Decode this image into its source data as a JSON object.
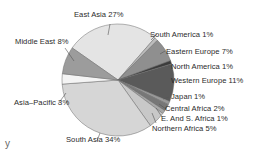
{
  "chart_data": {
    "type": "pie",
    "title": "",
    "start_angle_deg": -55,
    "direction": "clockwise",
    "slices": [
      {
        "label": "East Asia",
        "value": 27,
        "text": "East Asia 27%",
        "color": "#e4e4e4"
      },
      {
        "label": "South America",
        "value": 1,
        "text": "South America 1%",
        "color": "#bdbdbd"
      },
      {
        "label": "Eastern Europe",
        "value": 7,
        "text": "Eastern Europe 7%",
        "color": "#8f8f8f"
      },
      {
        "label": "North America",
        "value": 1,
        "text": "North America 1%",
        "color": "#3c3c3c"
      },
      {
        "label": "Western Europe",
        "value": 11,
        "text": "Western Europe 11%",
        "color": "#5a5a5a"
      },
      {
        "label": "Japan",
        "value": 1,
        "text": "Japan 1%",
        "color": "#9a9a9a"
      },
      {
        "label": "Central Africa",
        "value": 2,
        "text": "Central Africa 2%",
        "color": "#777777"
      },
      {
        "label": "E. And S. Africa",
        "value": 1,
        "text": "E. And S. Africa 1%",
        "color": "#a8a8a8"
      },
      {
        "label": "Northern Africa",
        "value": 5,
        "text": "Northern Africa 5%",
        "color": "#c8c8c8"
      },
      {
        "label": "South Asia",
        "value": 34,
        "text": "South Asia 34%",
        "color": "#d6d6d6"
      },
      {
        "label": "Asia-Pacific",
        "value": 3,
        "text": "Asia–Pacific 3%",
        "color": "#f4f4f4"
      },
      {
        "label": "Middle East",
        "value": 8,
        "text": "Middle East 8%",
        "color": "#9c9c9c"
      }
    ],
    "legend": "none (leader-line labels)"
  },
  "labels": {
    "east_asia": "East Asia 27%",
    "middle_east": "Middle East 8%",
    "south_america": "South America 1%",
    "eastern_europe": "Eastern Europe 7%",
    "north_america": "North America 1%",
    "western_europe": "Western Europe 11%",
    "asia_pacific": "Asia–Pacific 3%",
    "japan": "Japan 1%",
    "central_africa": "Central Africa 2%",
    "e_s_africa": "E. And S. Africa 1%",
    "northern_africa": "Northern Africa 5%",
    "south_asia": "South Asia 34%"
  },
  "stray_text": "y"
}
